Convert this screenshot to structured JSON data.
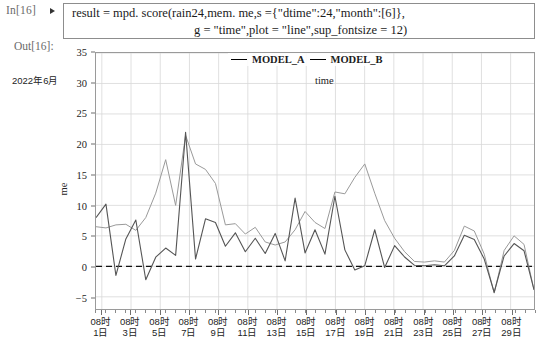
{
  "notebook": {
    "in_prompt": "In[16]",
    "out_prompt": "Out[16]:",
    "run_marker_icon": "play-triangle-icon",
    "code_line_1": "result = mpd. score(rain24,mem. me,s ={\"dtime\":24,\"month\":[6]},",
    "code_line_2": "g = \"time\",plot = \"line\",sup_fontsize = 12)"
  },
  "chart_data": {
    "type": "line",
    "title": "",
    "xlabel": "time",
    "ylabel": "me",
    "ylim": [
      -7,
      35
    ],
    "yticks": [
      35,
      30,
      25,
      20,
      15,
      10,
      5,
      0,
      -5
    ],
    "grid": true,
    "legend_position": "top-center",
    "zero_reference_line": 0,
    "x_month_label": "2022年6月",
    "xtick_labels": [
      "08时\n1日",
      "08时\n3日",
      "08时\n5日",
      "08时\n7日",
      "08时\n9日",
      "08时\n11日",
      "08时\n13日",
      "08时\n15日",
      "08时\n17日",
      "08时\n19日",
      "08时\n21日",
      "08时\n23日",
      "08时\n25日",
      "08时\n27日",
      "08时\n29日"
    ],
    "xtick_days": [
      1,
      3,
      5,
      7,
      9,
      11,
      13,
      15,
      17,
      19,
      21,
      23,
      25,
      27,
      29
    ],
    "x": [
      1,
      2,
      3,
      4,
      5,
      6,
      7,
      8,
      9,
      10,
      11,
      12,
      13,
      14,
      15,
      16,
      17,
      18,
      19,
      20,
      21,
      22,
      23,
      24,
      25,
      26,
      27,
      28,
      29,
      30
    ],
    "series": [
      {
        "name": "MODEL_A",
        "color": "#555555",
        "values": [
          8.0,
          10.2,
          -1.5,
          4.5,
          7.6,
          -2.2,
          1.5,
          3.0,
          1.8,
          22.0,
          1.2,
          7.8,
          7.2,
          3.3,
          5.5,
          2.4,
          4.6,
          2.1,
          5.4,
          0.9,
          11.2,
          2.2,
          6.0,
          2.0,
          11.5,
          2.7,
          -0.6,
          0.1,
          6.0,
          -0.2
        ]
      },
      {
        "name": "MODEL_B",
        "color": "#9a9a9a",
        "values": [
          6.5,
          6.3,
          6.8,
          6.9,
          5.9,
          8.0,
          12.0,
          17.5,
          10.0,
          21.5,
          16.8,
          15.9,
          13.6,
          6.8,
          7.0,
          5.3,
          6.4,
          4.0,
          3.5,
          4.0,
          6.0,
          9.0,
          7.2,
          6.2,
          12.2,
          11.9,
          14.6,
          16.8,
          12.0,
          7.5
        ]
      }
    ],
    "series_b_tail": [
      4.0,
      1.8,
      0.2,
      0.1,
      0.3,
      0.1,
      2.0,
      6.0,
      5.2,
      1.4,
      -5.0,
      2.0,
      4.4,
      3.0,
      -4.5
    ]
  }
}
